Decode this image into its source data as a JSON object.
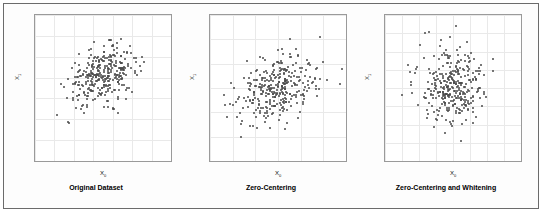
{
  "figure": {
    "background": "#ffffff",
    "border_color": "#6b6b6b",
    "point_color": "#4a4a4a"
  },
  "chart_data": [
    {
      "type": "scatter",
      "title": "Original Dataset",
      "xlabel": "X₀",
      "ylabel": "X₁",
      "xlim": [
        -30,
        40
      ],
      "ylim": [
        -20,
        15
      ],
      "xticks": [
        -30,
        -20,
        -10,
        0,
        10,
        20,
        30,
        40
      ],
      "yticks": [
        15,
        10,
        5,
        0,
        -5,
        -10,
        -15,
        -20
      ],
      "grid": true,
      "legend": "none",
      "n_points": 320,
      "mean": [
        5.0,
        0.5
      ],
      "std": [
        9.0,
        3.4
      ],
      "correlation": 0.35
    },
    {
      "type": "scatter",
      "title": "Zero-Centering",
      "xlabel": "X₀",
      "ylabel": "X₁",
      "xlim": [
        -30,
        30
      ],
      "ylim": [
        -15,
        15
      ],
      "xticks": [
        -30,
        -20,
        -10,
        0,
        10,
        20,
        30
      ],
      "yticks": [
        15,
        10,
        5,
        0,
        -5,
        -10,
        -15
      ],
      "grid": true,
      "legend": "none",
      "n_points": 320,
      "mean": [
        0.0,
        0.0
      ],
      "std": [
        9.0,
        3.4
      ],
      "correlation": 0.35
    },
    {
      "type": "scatter",
      "title": "Zero-Centering and Whitening",
      "xlabel": "X₀",
      "ylabel": "X₁",
      "xlim": [
        -4,
        4
      ],
      "ylim": [
        -4,
        4
      ],
      "xticks": [
        -4,
        -3,
        -2,
        -1,
        0,
        1,
        2,
        3
      ],
      "yticks": [
        4,
        3,
        2,
        1,
        0,
        -1,
        -2,
        -3,
        -4
      ],
      "grid": true,
      "legend": "none",
      "n_points": 320,
      "mean": [
        0.0,
        0.0
      ],
      "std": [
        1.0,
        1.0
      ],
      "correlation": 0.0
    }
  ],
  "captions": {
    "panel1": "Original Dataset",
    "panel2": "Zero-Centering",
    "panel3": "Zero-Centering and Whitening"
  },
  "axis_labels": {
    "x": "X",
    "x_sub": "0",
    "y": "X",
    "y_sub": "1"
  }
}
